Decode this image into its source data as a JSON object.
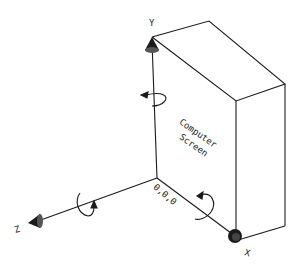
{
  "diagram": {
    "object_label_line1": "Computer",
    "object_label_line2": "Screen",
    "origin_label": "0,0,0",
    "axes": [
      {
        "name": "Y",
        "label": "Y"
      },
      {
        "name": "X",
        "label": "X"
      },
      {
        "name": "Z",
        "label": "Z"
      }
    ],
    "rotation_arrows": [
      "rotation-about-y",
      "rotation-about-z",
      "rotation-about-x"
    ],
    "colors": {
      "line": "#1a1a1a",
      "background": "#ffffff"
    }
  }
}
